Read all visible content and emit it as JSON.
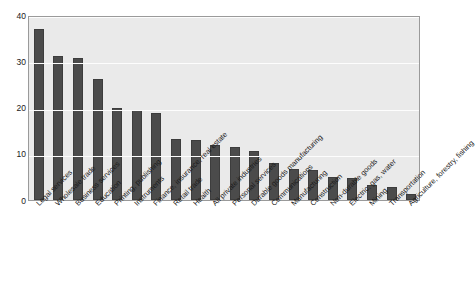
{
  "chart_data": {
    "type": "bar",
    "title": "",
    "xlabel": "",
    "ylabel": "",
    "ylim": [
      0,
      40
    ],
    "yticks": [
      0,
      10,
      20,
      30,
      40
    ],
    "grid": true,
    "legend": "none",
    "bar_color": "#4b4b4b",
    "plot_background": "#eaeaea",
    "gridline_color": "#fdfdfd",
    "categories": [
      "Legal services",
      "Wholesale trade",
      "Business services",
      "Education",
      "Printing, publishing",
      "Instruments",
      "Finance, insurance, real estate",
      "Retail trade",
      "Health",
      "All private industries",
      "Personal services",
      "Durable goods manufacturing",
      "Communications",
      "Manufacturing",
      "Construction",
      "Non-durable goods",
      "Electric, gas, water",
      "Mining",
      "Transportation",
      "Agriculture, forestry, fishing"
    ],
    "values": [
      37.0,
      31.2,
      30.6,
      26.2,
      19.8,
      19.4,
      18.8,
      13.3,
      13.0,
      11.8,
      11.4,
      10.5,
      8.0,
      6.8,
      6.5,
      5.0,
      4.7,
      3.3,
      2.8,
      1.2
    ]
  }
}
